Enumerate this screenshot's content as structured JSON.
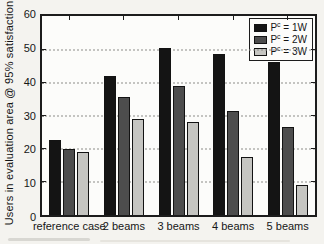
{
  "figure": {
    "paper_color": "#f4f3ef",
    "plot_background": "#fcfcfa",
    "ink_color": "#1c1c1c",
    "grid_color": "#8c8c88"
  },
  "chart_data": {
    "type": "bar",
    "title": "",
    "xlabel": "",
    "ylabel": "Users in evaluation area @ 95% satisfaction",
    "categories": [
      "reference case",
      "2 beams",
      "3 beams",
      "4 beams",
      "5 beams"
    ],
    "series": [
      {
        "name": "P^c = 1W",
        "color": "#141414",
        "values": [
          22.5,
          42,
          50.5,
          48.5,
          46
        ]
      },
      {
        "name": "P^c = 2W",
        "color": "#4d4d4d",
        "values": [
          20,
          35.5,
          39,
          31.5,
          26.5
        ]
      },
      {
        "name": "P^c = 3W",
        "color": "#c5c5c1",
        "values": [
          19,
          29,
          28,
          17.5,
          9
        ]
      }
    ],
    "legend": [
      {
        "base": "P",
        "sup": "c",
        "rest": " = 1W",
        "color": "#141414"
      },
      {
        "base": "P",
        "sup": "c",
        "rest": " = 2W",
        "color": "#4d4d4d"
      },
      {
        "base": "P",
        "sup": "c",
        "rest": " = 3W",
        "color": "#c5c5c1"
      }
    ],
    "ylim": [
      0,
      60
    ],
    "yticks": [
      0,
      10,
      20,
      30,
      40,
      50,
      60
    ],
    "grid": "horizontal dotted lines at 10,20,30,40,50",
    "legend_position": "top-right inside plot box"
  }
}
